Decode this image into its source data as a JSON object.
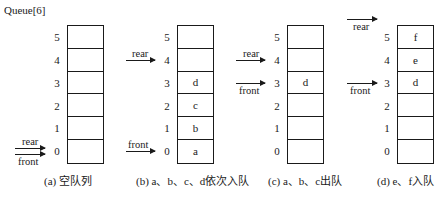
{
  "title": "Queue[6]",
  "indices": [
    "5",
    "4",
    "3",
    "2",
    "1",
    "0"
  ],
  "pointer_labels": {
    "rear": "rear",
    "front": "front"
  },
  "panels": [
    {
      "id": "a",
      "caption": "(a) 空队列",
      "cells": [
        "",
        "",
        "",
        "",
        "",
        ""
      ],
      "rear_index": 0,
      "front_index": 0
    },
    {
      "id": "b",
      "caption": "(b) a、b、c、d依次入队",
      "cells": [
        "",
        "",
        "d",
        "c",
        "b",
        "a"
      ],
      "rear_index": 4,
      "front_index": 0
    },
    {
      "id": "c",
      "caption": "(c) a、b、c出队",
      "cells": [
        "",
        "",
        "d",
        "",
        "",
        ""
      ],
      "rear_index": 4,
      "front_index": 3
    },
    {
      "id": "d",
      "caption": "(d) e、f入队",
      "cells": [
        "f",
        "e",
        "d",
        "",
        "",
        ""
      ],
      "rear_index": 6,
      "front_index": 3
    }
  ]
}
